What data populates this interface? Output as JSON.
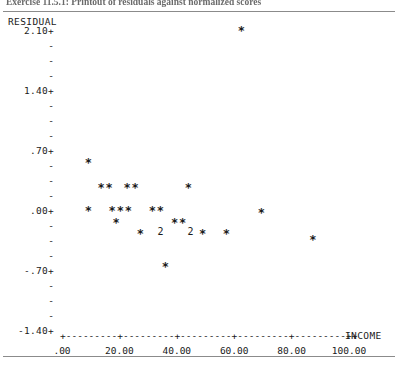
{
  "caption": "Exercise 11.5.1: Printout of residuals against normalized scores",
  "chart_data": {
    "type": "scatter",
    "xlabel": "INCOME",
    "ylabel": "RESIDUAL",
    "xlim": [
      0,
      105
    ],
    "ylim": [
      -1.4,
      2.1
    ],
    "xticks": [
      ".00",
      "20.00",
      "40.00",
      "60.00",
      "80.00",
      "100.00"
    ],
    "xtick_values": [
      0,
      20,
      40,
      60,
      80,
      100
    ],
    "yticks": [
      "2.10+",
      "1.40+",
      ".70+",
      ".00+",
      "-.70+",
      "-1.40+"
    ],
    "ytick_values": [
      2.1,
      1.4,
      0.7,
      0.0,
      -0.7,
      -1.4
    ],
    "minor_tick_glyph": "-",
    "point_glyph": "*",
    "overplot_glyph": "2",
    "grid": false,
    "legend": null,
    "points": [
      {
        "x": 62.5,
        "y": 2.12,
        "glyph": "*",
        "count": 1
      },
      {
        "x": 9.2,
        "y": 0.58,
        "glyph": "*",
        "count": 1
      },
      {
        "x": 13.6,
        "y": 0.29,
        "glyph": "*",
        "count": 1
      },
      {
        "x": 16.4,
        "y": 0.29,
        "glyph": "*",
        "count": 1
      },
      {
        "x": 22.7,
        "y": 0.29,
        "glyph": "*",
        "count": 1
      },
      {
        "x": 25.5,
        "y": 0.29,
        "glyph": "*",
        "count": 1
      },
      {
        "x": 44.0,
        "y": 0.29,
        "glyph": "*",
        "count": 1
      },
      {
        "x": 9.2,
        "y": 0.02,
        "glyph": "*",
        "count": 1
      },
      {
        "x": 17.5,
        "y": 0.02,
        "glyph": "*",
        "count": 1
      },
      {
        "x": 20.3,
        "y": 0.02,
        "glyph": "*",
        "count": 1
      },
      {
        "x": 23.1,
        "y": 0.02,
        "glyph": "*",
        "count": 1
      },
      {
        "x": 31.5,
        "y": 0.02,
        "glyph": "*",
        "count": 1
      },
      {
        "x": 34.3,
        "y": 0.02,
        "glyph": "*",
        "count": 1
      },
      {
        "x": 69.5,
        "y": 0.0,
        "glyph": "*",
        "count": 1
      },
      {
        "x": 18.9,
        "y": -0.12,
        "glyph": "*",
        "count": 1
      },
      {
        "x": 39.2,
        "y": -0.12,
        "glyph": "*",
        "count": 1
      },
      {
        "x": 42.0,
        "y": -0.12,
        "glyph": "*",
        "count": 1
      },
      {
        "x": 27.3,
        "y": -0.24,
        "glyph": "*",
        "count": 1
      },
      {
        "x": 34.3,
        "y": -0.24,
        "glyph": "2",
        "count": 2
      },
      {
        "x": 44.8,
        "y": -0.24,
        "glyph": "2",
        "count": 2
      },
      {
        "x": 49.0,
        "y": -0.24,
        "glyph": "*",
        "count": 1
      },
      {
        "x": 57.3,
        "y": -0.24,
        "glyph": "*",
        "count": 1
      },
      {
        "x": 87.4,
        "y": -0.32,
        "glyph": "*",
        "count": 1
      },
      {
        "x": 36.0,
        "y": -0.63,
        "glyph": "*",
        "count": 1
      }
    ]
  }
}
